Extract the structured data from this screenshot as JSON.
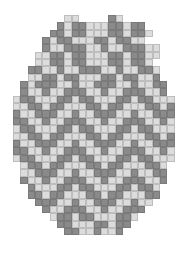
{
  "pattern": {
    "title": "",
    "shape": "oval",
    "columns": 22,
    "rows_count": 30,
    "colors": {
      "dark": "#8a8a8a",
      "light": "#dcdcdc",
      "background": "#ffffff"
    },
    "legend": {
      "D": "dark bead",
      "L": "light bead",
      " ": "empty"
    },
    "rows": [
      "       LL    DL       ",
      "      DLDDLLLDDLDD    ",
      "     DDLDDLLLDDLDDL   ",
      "    DLDDLLLDDLDDLL    ",
      "    DLLDDDLLDLLDDDLL  ",
      "   LLDDLDDLLLDDLDDLL  ",
      "   LLDDLDDLLLDDLDDL   ",
      "  DDLLDLLDDDLLDLLDDL  ",
      "  LLDDLDDLLLDDLDDLLD  ",
      " DLDDDLLDLLDDDLLDLLDD ",
      " DLLDLLDDDLLDLLDDDLLD ",
      "LDDLLLDDLDDLLLDDLDDLLL",
      "LLDDLDDLLLDDLDDLLLDDLD",
      "DLLDDDLLDLLDDDLLDLLDDD",
      "DDLLDLLDDDLLDLLDDDLLDL",
      "LDDLLLDDLDDLLLDDLDDLLL",
      "LLDDLDDLLLDDLDDLLLDDLD",
      "DLLDDDLLDLLDDDLLDLLDDD",
      "DDLLDLLDDDLLDLLDDDLLDL",
      "LDDLLLDDLDDLLLDDLDDLLL",
      " LDDLDDLLLDDLDDLLLDDL ",
      " LLDDDLLDLLDDDLLDLLDD ",
      " DLLDLLDDDLLDLLDDDLLD ",
      "  DLLLDDLDDLLLDDLDDL  ",
      "  DDLDDLLLDDLDDLLLDD  ",
      "   DDDLLDLLDDDLLDLL   ",
      "    DLLDDDLLDLLDDD    ",
      "     LDDLDDLLLDDL     ",
      "      DDLLLDDLDD      ",
      "       DDLLDLLD       "
    ]
  }
}
